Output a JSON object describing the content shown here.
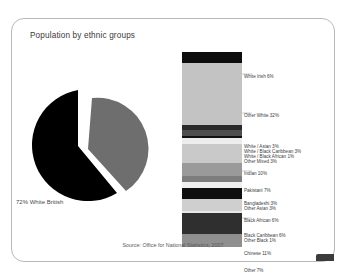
{
  "card": {
    "title": "Population by ethnic groups",
    "source": "Source: Office for National Statistics, 2007",
    "background_color": "#ffffff",
    "border_color": "#b8b8b8"
  },
  "chart_data": [
    {
      "type": "pie",
      "title": "Population by ethnic groups",
      "labels": [
        "White British",
        "Other ethnic groups"
      ],
      "values": [
        72,
        28
      ],
      "colors": [
        "#000000",
        "#6e6e6e"
      ],
      "annotations": [
        "72% White British"
      ],
      "exploded_slice": "Other ethnic groups",
      "legend": "none"
    },
    {
      "type": "bar",
      "orientation": "vertical-stacked",
      "title": "Breakdown of ethnic groups",
      "categories": [
        "White Irish",
        "Other White",
        "White / Asian",
        "White / Black Caribbean",
        "White / Black African",
        "Other Mixed",
        "Indian",
        "Pakistani",
        "Bangladeshi",
        "Other Asian",
        "Black African",
        "Black Caribbean",
        "Other Black",
        "Chinese",
        "Other"
      ],
      "values": [
        6,
        32,
        3,
        3,
        1,
        3,
        10,
        7,
        3,
        3,
        6,
        6,
        1,
        11,
        7
      ],
      "unit": "%",
      "colors": [
        "#0d0d0d",
        "#c3c3c3",
        "#2a2a2a",
        "#4e4e4e",
        "#111111",
        "#ededed",
        "#c9c9c9",
        "#9a9a9a",
        "#7d7d7d",
        "#efefef",
        "#0f0f0f",
        "#cfcfcf",
        "#e8e8e8",
        "#2f2f2f",
        "#8f8f8f"
      ],
      "grid": false,
      "legend": "right-side-labels"
    }
  ],
  "pie": {
    "label": "72% White British"
  },
  "bar_labels": [
    {
      "text": "White Irish 6%",
      "top": 22
    },
    {
      "text": "Other White 32%",
      "top": 61
    },
    {
      "text": "White / Asian 3%",
      "top": 92
    },
    {
      "text": "White / Black Caribbean 3%",
      "top": 97
    },
    {
      "text": "White / Black African 1%",
      "top": 102
    },
    {
      "text": "Other Mixed 3%",
      "top": 107
    },
    {
      "text": "Indian 10%",
      "top": 119
    },
    {
      "text": "Pakistani 7%",
      "top": 136
    },
    {
      "text": "Bangladeshi 3%",
      "top": 149
    },
    {
      "text": "Other Asian 3%",
      "top": 154
    },
    {
      "text": "Black African 6%",
      "top": 166
    },
    {
      "text": "Black Caribbean 6%",
      "top": 181
    },
    {
      "text": "Other Black 1%",
      "top": 186
    },
    {
      "text": "Chinese 11%",
      "top": 199
    },
    {
      "text": "Other 7%",
      "top": 216
    }
  ]
}
